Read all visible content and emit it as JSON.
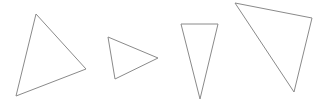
{
  "canvas": {
    "width": 324,
    "height": 110,
    "background": "#ffffff",
    "stroke_color": "#8a8a8a"
  },
  "shapes": [
    {
      "type": "triangle",
      "label": "triangle-1",
      "points": "36,14 86,69 16,96"
    },
    {
      "type": "triangle",
      "label": "triangle-2",
      "points": "108,37 158,58 115,79"
    },
    {
      "type": "triangle",
      "label": "triangle-3",
      "points": "181,24 218,24 200,99"
    },
    {
      "type": "triangle",
      "label": "triangle-4",
      "points": "235,3 312,18 294,92"
    }
  ]
}
